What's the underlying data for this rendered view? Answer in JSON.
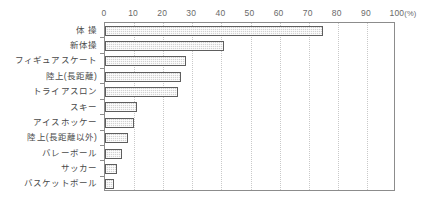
{
  "chart_data": {
    "type": "bar",
    "orientation": "horizontal",
    "title": "",
    "xlabel": "",
    "ylabel": "",
    "unit_label": "(%)",
    "xlim": [
      0,
      100
    ],
    "xticks": [
      0,
      10,
      20,
      30,
      40,
      50,
      60,
      70,
      80,
      90,
      100
    ],
    "grid": "vertical-dotted",
    "legend": "none",
    "categories": [
      "体 操",
      "新体操",
      "フィギュアスケート",
      "陸上(長距離)",
      "トライアスロン",
      "スキー",
      "アイスホッケー",
      "陸上(長距離以外)",
      "バレーボール",
      "サッカー",
      "バスケットボール"
    ],
    "values": [
      75,
      41,
      28,
      26,
      25,
      11,
      10,
      8,
      6,
      4,
      3
    ],
    "colors": {
      "bar_fill": "#d2d2d2",
      "bar_border": "#5e5e5e",
      "axis": "#8c8c8c",
      "gridline": "#c9c9c9",
      "text": "#4a4a4a"
    }
  }
}
